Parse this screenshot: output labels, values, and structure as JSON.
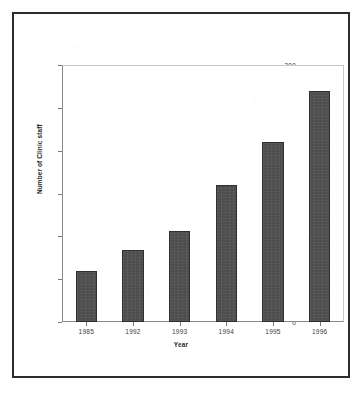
{
  "chart_data": {
    "type": "bar",
    "title": "",
    "xlabel": "Year",
    "ylabel": "Number of Clinic staff",
    "categories": [
      "1985",
      "1992",
      "1993",
      "1994",
      "1995",
      "1996"
    ],
    "values": [
      60,
      84,
      106,
      160,
      210,
      270
    ],
    "ylim": [
      0,
      300
    ],
    "yticks": [
      0,
      50,
      100,
      150,
      200,
      250,
      300
    ],
    "ytick_labels": [
      "0",
      "50",
      "100",
      "150",
      "200",
      "250",
      "300"
    ],
    "grid": false,
    "legend": null,
    "series": [
      {
        "name": "Number of Clinic staff",
        "values": [
          60,
          84,
          106,
          160,
          210,
          270
        ],
        "color": "#4d4d4d"
      }
    ],
    "colors": {
      "bar_fill": "#4d4d4d",
      "bar_edge": "#2f2f2f",
      "axis": "#8a8a8a",
      "frame": "#2c2c2c",
      "text": "#3a3a3a",
      "background": "#ffffff"
    }
  }
}
